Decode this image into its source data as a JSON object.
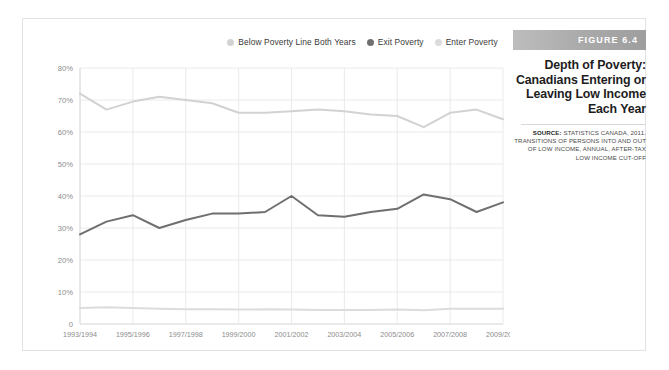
{
  "figure": {
    "banner_label": "FIGURE 6.4",
    "title_lines": [
      "Depth of Poverty:",
      "Canadians Entering or",
      "Leaving Low Income",
      "Each Year"
    ],
    "source_label": "SOURCE:",
    "source_text": "STATISTICS CANADA, 2011. TRANSITIONS OF PERSONS INTO AND OUT OF LOW INCOME, ANNUAL, AFTER-TAX LOW INCOME CUT-OFF",
    "source_lines": [
      "STATISTICS CANADA, 2011.",
      "TRANSITIONS OF PERSONS INTO AND OUT",
      "OF LOW INCOME, ANNUAL, AFTER-TAX LOW",
      "INCOME CUT-OFF"
    ]
  },
  "colors": {
    "below_poverty": "#d2d2d2",
    "exit_poverty": "#6f6f6f",
    "enter_poverty": "#dcdcdc",
    "banner": "#aeaeae",
    "grid": "#e4e4e4",
    "axis_text": "#8c8c8c",
    "frame": "#e3e3e3",
    "background": "#ffffff"
  },
  "chart_data": {
    "type": "line",
    "xlabel": "",
    "ylabel": "",
    "ylim": [
      0,
      80
    ],
    "ytick_values": [
      0,
      10,
      20,
      30,
      40,
      50,
      60,
      70,
      80
    ],
    "ytick_labels": [
      "0",
      "10%",
      "20%",
      "30%",
      "40%",
      "50%",
      "60%",
      "70%",
      "80%"
    ],
    "grid": true,
    "legend_position": "top-center",
    "x": [
      "1993/1994",
      "1994/1995",
      "1995/1996",
      "1996/1997",
      "1997/1998",
      "1998/1999",
      "1999/2000",
      "2000/2001",
      "2001/2002",
      "2002/2003",
      "2003/2004",
      "2004/2005",
      "2005/2006",
      "2006/2007",
      "2007/2008",
      "2008/2009",
      "2009/2010"
    ],
    "xtick_labels": [
      "1993/1994",
      "1995/1996",
      "1997/1998",
      "1999/2000",
      "2001/2002",
      "2003/2004",
      "2005/2006",
      "2007/2008",
      "2009/2010"
    ],
    "series": [
      {
        "name": "Below Poverty Line Both Years",
        "color": "#d2d2d2",
        "values": [
          72,
          67,
          69.5,
          71,
          70,
          69,
          66,
          66,
          66.5,
          67,
          66.5,
          65.5,
          65,
          61.5,
          66,
          67,
          64
        ]
      },
      {
        "name": "Exit Poverty",
        "color": "#6f6f6f",
        "values": [
          28,
          32,
          34,
          30,
          32.5,
          34.5,
          34.5,
          35,
          40,
          34,
          33.5,
          35,
          36,
          40.5,
          39,
          35,
          38
        ]
      },
      {
        "name": "Enter Poverty",
        "color": "#dcdcdc",
        "values": [
          5,
          5.2,
          5,
          4.8,
          4.6,
          4.6,
          4.5,
          4.6,
          4.5,
          4.4,
          4.4,
          4.4,
          4.5,
          4.3,
          4.8,
          4.8,
          4.8
        ]
      }
    ]
  },
  "legend": {
    "items": [
      {
        "label": "Below Poverty Line Both Years",
        "color": "#d2d2d2"
      },
      {
        "label": "Exit Poverty",
        "color": "#6f6f6f"
      },
      {
        "label": "Enter Poverty",
        "color": "#dcdcdc"
      }
    ]
  }
}
